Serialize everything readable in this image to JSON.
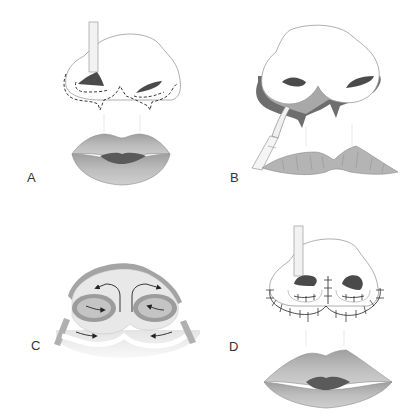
{
  "figure": {
    "type": "surgical-illustration",
    "panels": [
      {
        "id": "A",
        "label": "A",
        "description": "Nose with dashed incision lines around alar bases, retractor in left nostril, lips below"
      },
      {
        "id": "B",
        "label": "B",
        "description": "Nose elevated showing exposed undersurface flaps, elevator instrument at left, upper lip below"
      },
      {
        "id": "C",
        "label": "C",
        "description": "Basal view of nostrils with arrows indicating flap rotation/advancement"
      },
      {
        "id": "D",
        "label": "D",
        "description": "Nose after closure with sutures around alar bases, retractor in left nostril, lips below"
      }
    ]
  },
  "colors": {
    "background": "#ffffff",
    "outline": "#8a8a8a",
    "nostril_dark": "#4a4a4a",
    "lip_fill": "#b4b4b4",
    "lip_shadow": "#9a9a9a",
    "lip_mouth": "#5a5a5a",
    "flap_dark": "#6e6e6e",
    "flap_mid": "#a8a8a8",
    "base_light": "#e6e6e6",
    "ring_gray": "#9c9c9c",
    "label_text": "#333333"
  }
}
